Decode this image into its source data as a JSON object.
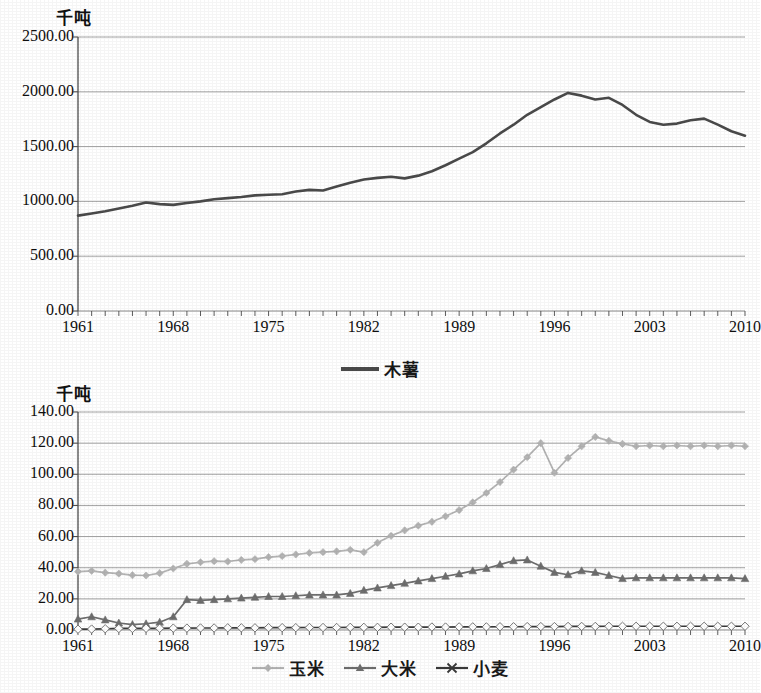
{
  "chart_data": [
    {
      "id": "cassava",
      "type": "line",
      "title": "",
      "ylabel": "千吨",
      "xlabel": "",
      "ylim": [
        0,
        2500
      ],
      "yticks": [
        "0.00",
        "500.00",
        "1000.00",
        "1500.00",
        "2000.00",
        "2500.00"
      ],
      "ytick_values": [
        0,
        500,
        1000,
        1500,
        2000,
        2500
      ],
      "xlim": [
        1961,
        2010
      ],
      "xticks": [
        "1961",
        "1968",
        "1975",
        "1982",
        "1989",
        "1996",
        "2003",
        "2010"
      ],
      "xtick_values": [
        1961,
        1968,
        1975,
        1982,
        1989,
        1996,
        2003,
        2010
      ],
      "grid": true,
      "legend_position": "bottom-center",
      "legend": [
        "木薯"
      ],
      "x": [
        1961,
        1962,
        1963,
        1964,
        1965,
        1966,
        1967,
        1968,
        1969,
        1970,
        1971,
        1972,
        1973,
        1974,
        1975,
        1976,
        1977,
        1978,
        1979,
        1980,
        1981,
        1982,
        1983,
        1984,
        1985,
        1986,
        1987,
        1988,
        1989,
        1990,
        1991,
        1992,
        1993,
        1994,
        1995,
        1996,
        1997,
        1998,
        1999,
        2000,
        2001,
        2002,
        2003,
        2004,
        2005,
        2006,
        2007,
        2008,
        2009,
        2010
      ],
      "series": [
        {
          "name": "木薯",
          "color": "#4a4a4a",
          "marker": "none",
          "values": [
            870,
            890,
            910,
            935,
            960,
            990,
            975,
            968,
            985,
            1000,
            1020,
            1030,
            1040,
            1055,
            1060,
            1065,
            1090,
            1105,
            1100,
            1135,
            1170,
            1200,
            1215,
            1225,
            1210,
            1235,
            1275,
            1330,
            1390,
            1450,
            1530,
            1620,
            1700,
            1790,
            1860,
            1930,
            1990,
            1965,
            1930,
            1945,
            1880,
            1790,
            1725,
            1700,
            1710,
            1740,
            1755,
            1700,
            1640,
            1600
          ]
        }
      ]
    },
    {
      "id": "grains",
      "type": "line",
      "title": "",
      "ylabel": "千吨",
      "xlabel": "",
      "ylim": [
        0,
        140
      ],
      "yticks": [
        "0.00",
        "20.00",
        "40.00",
        "60.00",
        "80.00",
        "100.00",
        "120.00",
        "140.00"
      ],
      "ytick_values": [
        0,
        20,
        40,
        60,
        80,
        100,
        120,
        140
      ],
      "xlim": [
        1961,
        2010
      ],
      "xticks": [
        "1961",
        "1968",
        "1975",
        "1982",
        "1989",
        "1996",
        "2003",
        "2010"
      ],
      "xtick_values": [
        1961,
        1968,
        1975,
        1982,
        1989,
        1996,
        2003,
        2010
      ],
      "grid": true,
      "legend_position": "bottom-center",
      "legend": [
        "玉米",
        "大米",
        "小麦"
      ],
      "x": [
        1961,
        1962,
        1963,
        1964,
        1965,
        1966,
        1967,
        1968,
        1969,
        1970,
        1971,
        1972,
        1973,
        1974,
        1975,
        1976,
        1977,
        1978,
        1979,
        1980,
        1981,
        1982,
        1983,
        1984,
        1985,
        1986,
        1987,
        1988,
        1989,
        1990,
        1991,
        1992,
        1993,
        1994,
        1995,
        1996,
        1997,
        1998,
        1999,
        2000,
        2001,
        2002,
        2003,
        2004,
        2005,
        2006,
        2007,
        2008,
        2009,
        2010
      ],
      "series": [
        {
          "name": "玉米",
          "color": "#b4b4b4",
          "marker": "diamond",
          "values": [
            37.5,
            38.0,
            36.8,
            36.2,
            35.2,
            35.0,
            36.5,
            39.5,
            42.5,
            43.5,
            44.2,
            44.0,
            45.0,
            45.5,
            46.8,
            47.5,
            48.5,
            49.5,
            50.0,
            50.5,
            51.5,
            50.0,
            56.0,
            60.5,
            64.0,
            67.0,
            69.5,
            73.0,
            77.0,
            82.0,
            88.0,
            95.0,
            103.0,
            111.0,
            120.0,
            101.0,
            110.5,
            118.0,
            124.0,
            121.5,
            119.5,
            118.0,
            118.5,
            118.0,
            118.5,
            118.0,
            118.5,
            118.0,
            118.5,
            118.0
          ]
        },
        {
          "name": "大米",
          "color": "#6e6e6e",
          "marker": "triangle",
          "values": [
            7.0,
            8.5,
            6.5,
            4.5,
            3.5,
            4.0,
            5.0,
            8.5,
            19.5,
            19.0,
            19.5,
            20.0,
            20.5,
            21.0,
            21.5,
            21.5,
            22.0,
            22.5,
            22.5,
            22.5,
            23.5,
            25.5,
            27.0,
            28.5,
            30.0,
            31.5,
            33.0,
            34.5,
            36.0,
            38.0,
            39.5,
            42.0,
            44.5,
            45.0,
            41.0,
            37.0,
            35.5,
            38.0,
            37.0,
            35.0,
            33.0,
            33.5,
            33.5,
            33.5,
            33.5,
            33.5,
            33.5,
            33.5,
            33.5,
            33.0
          ]
        },
        {
          "name": "小麦",
          "color": "#3a3a3a",
          "marker": "x",
          "values": [
            0.5,
            0.6,
            0.8,
            1.0,
            1.0,
            1.1,
            1.1,
            1.2,
            1.2,
            1.3,
            1.3,
            1.4,
            1.4,
            1.4,
            1.5,
            1.5,
            1.5,
            1.6,
            1.6,
            1.6,
            1.7,
            1.7,
            1.7,
            1.8,
            1.8,
            1.8,
            1.9,
            1.9,
            2.0,
            2.0,
            2.0,
            2.1,
            2.1,
            2.2,
            2.2,
            2.2,
            2.3,
            2.3,
            2.3,
            2.4,
            2.4,
            2.4,
            2.4,
            2.4,
            2.4,
            2.4,
            2.4,
            2.4,
            2.4,
            2.4
          ]
        }
      ]
    }
  ]
}
